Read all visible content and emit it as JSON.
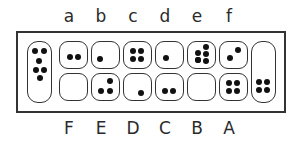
{
  "diagram": {
    "type": "mancala-board",
    "top_labels": [
      "a",
      "b",
      "c",
      "d",
      "e",
      "f"
    ],
    "bottom_labels": [
      "F",
      "E",
      "D",
      "C",
      "B",
      "A"
    ],
    "top_row_seeds": {
      "a": 2,
      "b": 1,
      "c": 4,
      "d": 1,
      "e": 6,
      "f": 2
    },
    "bottom_row_seeds": {
      "F": 0,
      "E": 3,
      "D": 1,
      "C": 2,
      "B": 0,
      "A": 4
    },
    "left_store_seeds": 6,
    "right_store_seeds": 4,
    "colors": {
      "line": "#333333",
      "seed": "#111111",
      "background": "#ffffff"
    }
  }
}
